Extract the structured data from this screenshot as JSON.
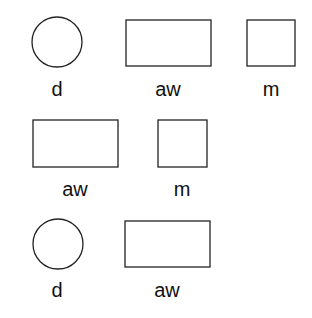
{
  "rows": [
    {
      "items": [
        {
          "shape": "circle",
          "label": "d"
        },
        {
          "shape": "rectangle",
          "label": "aw"
        },
        {
          "shape": "square",
          "label": "m"
        }
      ]
    },
    {
      "items": [
        {
          "shape": "rectangle",
          "label": "aw"
        },
        {
          "shape": "square",
          "label": "m"
        }
      ]
    },
    {
      "items": [
        {
          "shape": "circle",
          "label": "d"
        },
        {
          "shape": "rectangle",
          "label": "aw"
        }
      ]
    }
  ]
}
